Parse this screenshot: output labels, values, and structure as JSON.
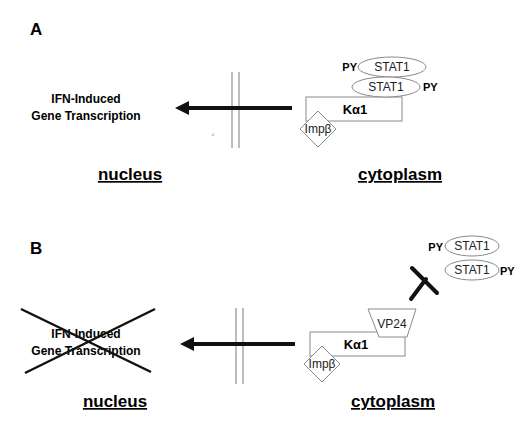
{
  "panels": [
    {
      "label": "A",
      "gene_text_line1": "IFN-Induced",
      "gene_text_line2": "Gene Transcription",
      "nucleus_label": "nucleus",
      "cytoplasm_label": "cytoplasm",
      "karyopherin_label": "Kα1",
      "importin_label": "Impβ",
      "stat_top": "STAT1",
      "stat_bottom": "STAT1",
      "py_top": "PY",
      "py_bottom": "PY",
      "transcription_blocked": false
    },
    {
      "label": "B",
      "gene_text_line1": "IFN-Induced",
      "gene_text_line2": "Gene Transcription",
      "nucleus_label": "nucleus",
      "cytoplasm_label": "cytoplasm",
      "karyopherin_label": "Kα1",
      "importin_label": "Impβ",
      "vp24_label": "VP24",
      "stat_top": "STAT1",
      "stat_bottom": "STAT1",
      "py_top": "PY",
      "py_bottom": "PY",
      "transcription_blocked": true
    }
  ],
  "colors": {
    "line": "#111111",
    "outline": "#8a8a8a",
    "membrane": "#7a7a7a"
  }
}
